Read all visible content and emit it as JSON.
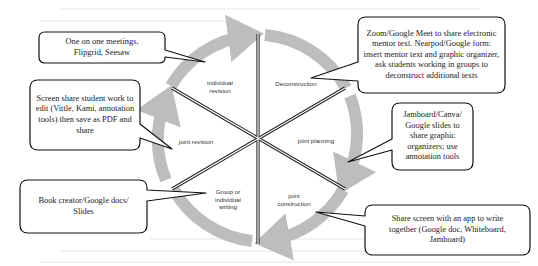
{
  "diagram": {
    "title": "",
    "type": "cycle",
    "ring_color": "#bdbdbd",
    "stages": [
      {
        "id": "deconstruction",
        "label": "Deconstruction"
      },
      {
        "id": "joint-planning",
        "label": "joint planning"
      },
      {
        "id": "joint-construction",
        "label": "joint\nconstruction"
      },
      {
        "id": "group-individual-writing",
        "label": "Group or\nindividual\nwriting"
      },
      {
        "id": "joint-revision",
        "label": "joint revision"
      },
      {
        "id": "individual-revision",
        "label": "individual\nrevision"
      }
    ],
    "callouts": [
      {
        "stage": "individual-revision",
        "text": "One on one meetings, Flipgrid, Seesaw"
      },
      {
        "stage": "joint-revision",
        "text": "Screen share student work to edit (Vittle, Kami, annotation tools) then save as PDF and share"
      },
      {
        "stage": "deconstruction",
        "text": "Zoom/Google Meet to share electronic mentor text. Nearpod/Google form: insert mentor text and graphic organizer, ask students working in groups to deconstruct additional texts"
      },
      {
        "stage": "joint-planning",
        "text": "Jamboard/Canva/ Google slides to share graphic organizers; use annotation tools"
      },
      {
        "stage": "group-individual-writing",
        "text": "Book creator/Google docs/ Slides"
      },
      {
        "stage": "joint-construction",
        "text": "Share screen with an app to write together (Google doc, Whiteboard, Jamboard)"
      }
    ]
  }
}
